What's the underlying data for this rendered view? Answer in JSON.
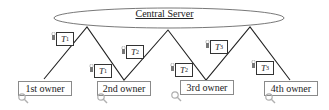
{
  "server": {
    "label": "Central Server"
  },
  "owners": [
    {
      "label": "1st owner"
    },
    {
      "label": "2nd owner"
    },
    {
      "label": "3rd owner"
    },
    {
      "label": "4th owner"
    }
  ],
  "tokens": [
    {
      "symbol": "T",
      "sub": "1"
    },
    {
      "symbol": "T",
      "sub": "1"
    },
    {
      "symbol": "T",
      "sub": "2"
    },
    {
      "symbol": "T",
      "sub": "2"
    },
    {
      "symbol": "T",
      "sub": "3"
    },
    {
      "symbol": "T",
      "sub": "3"
    }
  ],
  "colors": {
    "line": "#222222",
    "ellipse": "#555555",
    "box_border": "#8a8a8a",
    "magnifier": "#b0b0b0"
  }
}
